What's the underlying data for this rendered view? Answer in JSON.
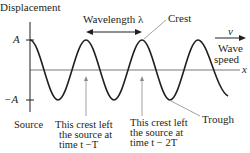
{
  "diagram": {
    "y_axis_label": "Displacement",
    "x_axis_label": "x",
    "amplitude_pos": "A",
    "amplitude_neg": "−A",
    "wavelength_label": "Wavelength λ",
    "crest_label": "Crest",
    "trough_label": "Trough",
    "speed_symbol": "v",
    "speed_label_line1": "Wave",
    "speed_label_line2": "speed",
    "source_label": "Source",
    "crest1": {
      "line1": "This crest left",
      "line2": "the source at",
      "line3": "time t −T"
    },
    "crest2": {
      "line1": "This crest left",
      "line2": "the source at",
      "line3": "time t − 2T"
    },
    "colors": {
      "line": "#231f20",
      "leader": "#8a8a8a",
      "background": "#ffffff"
    }
  }
}
